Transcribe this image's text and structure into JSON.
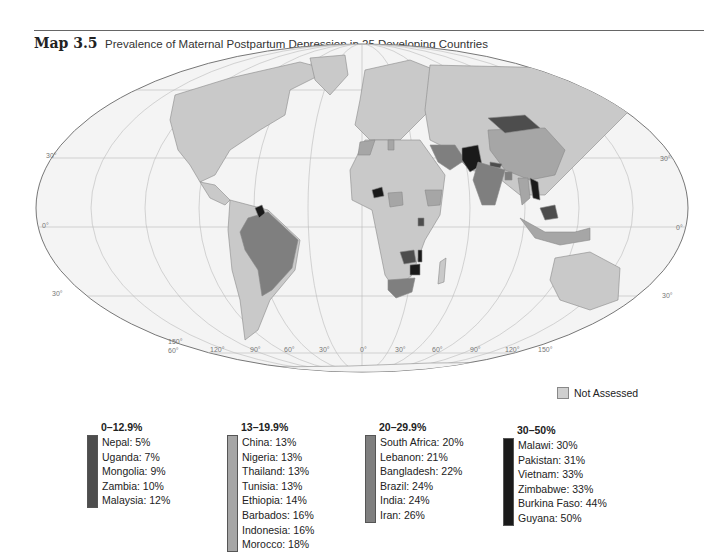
{
  "figure": {
    "label": "Map 3.5",
    "title": "Prevalence of Maternal Postpartum Depression in 25 Developing Countries"
  },
  "colors": {
    "not_assessed": "#cfcfcf",
    "band_0_12_9": "#4d4d4d",
    "band_13_19_9": "#a6a6a6",
    "band_20_29_9": "#7f7f7f",
    "band_30_50": "#1a1a1a",
    "ocean": "#f4f4f4",
    "land_default": "#c9c9c9"
  },
  "graticule_labels": {
    "latitudes_left": [
      "30°",
      "0°",
      "30°"
    ],
    "latitudes_right": [
      "30°",
      "0°",
      "30°"
    ],
    "longitudes_bottom": [
      "150°",
      "120°",
      "90°",
      "60°",
      "30°",
      "0°",
      "30°",
      "60°",
      "90°",
      "120°",
      "150°"
    ],
    "lat_60_label": "60°"
  },
  "legend": {
    "not_assessed_label": "Not Assessed",
    "bands": [
      {
        "range": "0–12.9%",
        "countries": [
          "Nepal: 5%",
          "Uganda: 7%",
          "Mongolia: 9%",
          "Zambia: 10%",
          "Malaysia: 12%"
        ]
      },
      {
        "range": "13–19.9%",
        "countries": [
          "China: 13%",
          "Nigeria: 13%",
          "Thailand: 13%",
          "Tunisia: 13%",
          "Ethiopia: 14%",
          "Barbados: 16%",
          "Indonesia: 16%",
          "Morocco: 18%"
        ]
      },
      {
        "range": "20–29.9%",
        "countries": [
          "South Africa: 20%",
          "Lebanon: 21%",
          "Bangladesh: 22%",
          "Brazil: 24%",
          "India: 24%",
          "Iran: 26%"
        ]
      },
      {
        "range": "30–50%",
        "countries": [
          "Malawi: 30%",
          "Pakistan: 31%",
          "Vietnam: 33%",
          "Zimbabwe: 33%",
          "Burkina Faso: 44%",
          "Guyana: 50%"
        ]
      }
    ]
  }
}
